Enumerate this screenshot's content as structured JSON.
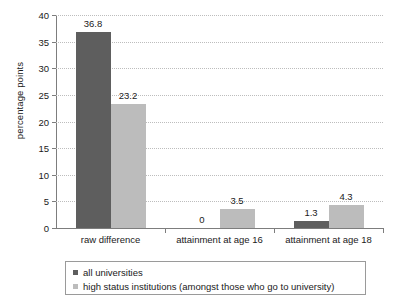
{
  "chart_data": {
    "type": "bar",
    "title": "",
    "xlabel": "",
    "ylabel": "percentage points",
    "ylim": [
      0,
      40
    ],
    "ytick_step": 5,
    "yticks": [
      0,
      5,
      10,
      15,
      20,
      25,
      30,
      35,
      40
    ],
    "ytick_labels": [
      "0",
      "5",
      "10",
      "15",
      "20",
      "25",
      "30",
      "35",
      "40"
    ],
    "grid": true,
    "grid_axis": "y",
    "legend_position": "bottom",
    "categories": [
      "raw difference",
      "attainment at age 16",
      "attainment at age 18"
    ],
    "series": [
      {
        "name": "all universities",
        "color": "#5e5e5e",
        "values": [
          36.8,
          0,
          1.3
        ],
        "labels": [
          "36.8",
          "0",
          "1.3"
        ]
      },
      {
        "name": "high status institutions (amongst those who go to university)",
        "color": "#bcbcbc",
        "values": [
          23.2,
          3.5,
          4.3
        ],
        "labels": [
          "23.2",
          "3.5",
          "4.3"
        ]
      }
    ]
  },
  "legend": {
    "items": [
      {
        "label": "all universities",
        "color": "#5e5e5e"
      },
      {
        "label": "high status institutions (amongst those who go to university)",
        "color": "#bcbcbc"
      }
    ]
  },
  "axis": {
    "y_title": "percentage points"
  }
}
